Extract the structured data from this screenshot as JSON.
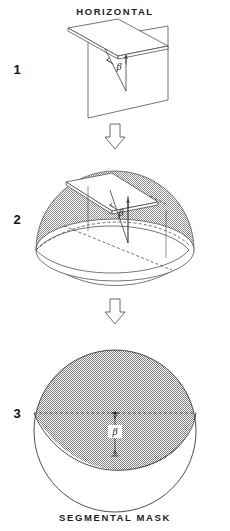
{
  "figure": {
    "title_top": "HORIZONTAL",
    "title_bottom": "SEGMENTAL MASK",
    "background_color": "#ffffff",
    "ink_color": "#3a3a3a",
    "shade_color": "#9b9b9b",
    "panels": [
      {
        "number": "1",
        "name": "horizontal-plane-panel",
        "angle_label": "β",
        "description_parts": [
          "horizontal-slab",
          "vertical-plane",
          "angle-arrows"
        ]
      },
      {
        "number": "2",
        "name": "sphere-projection-panel",
        "angle_label": "β",
        "description_parts": [
          "hemisphere",
          "shaded-cap",
          "base-ellipse",
          "slab",
          "drop-lines"
        ]
      },
      {
        "number": "3",
        "name": "segmental-mask-panel",
        "angle_label": "β",
        "description_parts": [
          "circle",
          "dashed-diameter",
          "shaded-segment",
          "beta-dimension"
        ]
      }
    ],
    "flow_arrows": [
      {
        "name": "flow-arrow-1-to-2",
        "direction": "down"
      },
      {
        "name": "flow-arrow-2-to-3",
        "direction": "down"
      }
    ]
  }
}
